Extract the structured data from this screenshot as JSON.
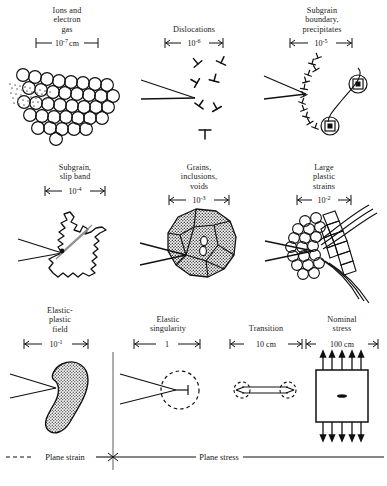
{
  "figure": {
    "title_implicit": "Length scales of fracture process zones",
    "ink_color": "#111111",
    "stipple_color": "#4a4a4a"
  },
  "rows": [
    {
      "row_index": 1,
      "cells": [
        {
          "id": "ions-electron-gas",
          "caption_lines": [
            "Ions and",
            "electron",
            "gas"
          ],
          "scale_mantissa": "10",
          "scale_exponent": "-7",
          "scale_unit": "cm",
          "scale_label": "10⁻⁷ cm",
          "art": "atom-lattice-with-crack"
        },
        {
          "id": "dislocations",
          "caption_lines": [
            "Dislocations"
          ],
          "scale_mantissa": "10",
          "scale_exponent": "-6",
          "scale_unit": "",
          "scale_label": "10⁻⁶",
          "art": "dislocation-symbols-with-crack"
        },
        {
          "id": "subgrain-boundary-precipitates",
          "caption_lines": [
            "Subgrain",
            "boundary,",
            "precipitates"
          ],
          "scale_mantissa": "10",
          "scale_exponent": "-5",
          "scale_unit": "",
          "scale_label": "10⁻⁵",
          "art": "subgrain-boundary-and-precipitates"
        }
      ]
    },
    {
      "row_index": 2,
      "cells": [
        {
          "id": "subgrain-slip-band",
          "caption_lines": [
            "Subgrain,",
            "slip band"
          ],
          "scale_mantissa": "10",
          "scale_exponent": "-4",
          "scale_unit": "",
          "scale_label": "10⁻⁴",
          "art": "jagged-subgrain-with-slip-band"
        },
        {
          "id": "grains-inclusions-voids",
          "caption_lines": [
            "Grains,",
            "inclusions,",
            "voids"
          ],
          "scale_mantissa": "10",
          "scale_exponent": "-3",
          "scale_unit": "",
          "scale_label": "10⁻³",
          "art": "polycrystal-blob-with-voids"
        },
        {
          "id": "large-plastic-strains",
          "caption_lines": [
            "Large",
            "plastic",
            "strains"
          ],
          "scale_mantissa": "10",
          "scale_exponent": "-2",
          "scale_unit": "",
          "scale_label": "10⁻²",
          "art": "distorted-grains-with-flow-lines"
        }
      ]
    },
    {
      "row_index": 3,
      "cells": [
        {
          "id": "elastic-plastic-field",
          "caption_lines": [
            "Elastic-",
            "plastic",
            "field"
          ],
          "scale_mantissa": "10",
          "scale_exponent": "-1",
          "scale_unit": "",
          "scale_label": "10⁻¹",
          "art": "kidney-plastic-zone"
        },
        {
          "id": "elastic-singularity",
          "caption_lines": [
            "Elastic",
            "singularity"
          ],
          "scale_mantissa": "1",
          "scale_exponent": "",
          "scale_unit": "",
          "scale_label": "1",
          "art": "dashed-circle-singularity"
        },
        {
          "id": "transition",
          "caption_lines": [
            "Transition"
          ],
          "scale_mantissa": "10",
          "scale_exponent": "",
          "scale_unit": "cm",
          "scale_label": "10 cm",
          "art": "two-dashed-circles-crack"
        },
        {
          "id": "nominal-stress",
          "caption_lines": [
            "Nominal",
            "stress"
          ],
          "scale_mantissa": "100",
          "scale_exponent": "",
          "scale_unit": "cm",
          "scale_label": "100 cm",
          "art": "loaded-specimen-with-crack"
        }
      ]
    }
  ],
  "regime_bar": {
    "left_label": "Plane strain",
    "right_label": "Plane stress",
    "left_line_style": "dashed",
    "right_line_style": "solid"
  }
}
